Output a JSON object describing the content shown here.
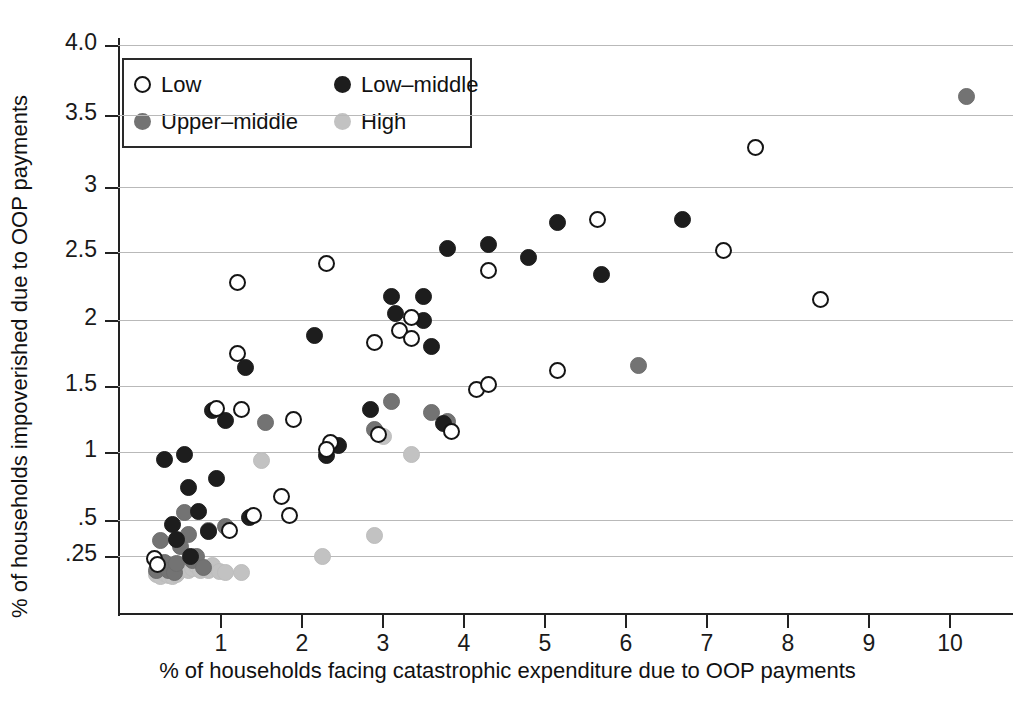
{
  "chart_data": {
    "type": "scatter",
    "title": "",
    "xlabel": "% of households facing catastrophic expenditure due to OOP payments",
    "ylabel": "% of households impoverished due to OOP payments",
    "xlim": [
      0.05,
      10.7
    ],
    "ylim": [
      0.1,
      4.15
    ],
    "x_ticks": [
      "1",
      "2",
      "3",
      "4",
      "5",
      "6",
      "7",
      "8",
      "9",
      "10"
    ],
    "x_tick_values": [
      1,
      2,
      3,
      4,
      5,
      6,
      7,
      8,
      9,
      10
    ],
    "y_ticks": [
      ".25",
      ".5",
      "1",
      "1.5",
      "2",
      "2.5",
      "3",
      "3.5",
      "4.0"
    ],
    "y_tick_values": [
      0.25,
      0.5,
      1,
      1.5,
      2,
      2.5,
      3,
      3.5,
      4.0
    ],
    "grid": "horizontal",
    "legend_position": "top-left",
    "legend": [
      {
        "key": "low",
        "label": "Low",
        "color": "#ffffff",
        "edge": "#141414"
      },
      {
        "key": "lowmid",
        "label": "Low–middle",
        "color": "#1d1d1d",
        "edge": "#1d1d1d"
      },
      {
        "key": "uppermid",
        "label": "Upper–middle",
        "color": "#737373",
        "edge": "#6e6e6e"
      },
      {
        "key": "high",
        "label": "High",
        "color": "#c2c2c2",
        "edge": "#bdbdbd"
      }
    ],
    "series": [
      {
        "name": "Low",
        "key": "low",
        "points": [
          [
            0.18,
            0.235
          ],
          [
            0.22,
            0.205
          ],
          [
            0.95,
            1.315
          ],
          [
            1.2,
            2.27
          ],
          [
            1.2,
            1.735
          ],
          [
            1.25,
            1.31
          ],
          [
            1.1,
            0.415
          ],
          [
            1.4,
            0.525
          ],
          [
            1.75,
            0.65
          ],
          [
            1.85,
            0.525
          ],
          [
            1.9,
            1.235
          ],
          [
            2.3,
            2.41
          ],
          [
            2.35,
            1.065
          ],
          [
            2.3,
            1.02
          ],
          [
            2.9,
            1.825
          ],
          [
            3.2,
            1.915
          ],
          [
            3.35,
            2.02
          ],
          [
            3.35,
            1.855
          ],
          [
            2.95,
            1.12
          ],
          [
            3.85,
            1.145
          ],
          [
            4.15,
            1.475
          ],
          [
            4.3,
            1.51
          ],
          [
            4.3,
            2.355
          ],
          [
            5.15,
            1.61
          ],
          [
            5.65,
            2.745
          ],
          [
            7.2,
            2.51
          ],
          [
            7.6,
            3.27
          ],
          [
            8.4,
            2.145
          ]
        ]
      },
      {
        "name": "Low–middle",
        "key": "lowmid",
        "points": [
          [
            0.3,
            0.94
          ],
          [
            0.4,
            0.465
          ],
          [
            0.45,
            0.355
          ],
          [
            0.55,
            0.975
          ],
          [
            0.6,
            0.72
          ],
          [
            0.62,
            0.25
          ],
          [
            0.72,
            0.555
          ],
          [
            0.85,
            0.41
          ],
          [
            0.95,
            0.785
          ],
          [
            0.9,
            1.305
          ],
          [
            1.05,
            1.225
          ],
          [
            1.3,
            1.63
          ],
          [
            1.35,
            0.515
          ],
          [
            2.15,
            1.88
          ],
          [
            2.3,
            0.97
          ],
          [
            2.45,
            1.045
          ],
          [
            2.85,
            1.31
          ],
          [
            3.1,
            2.17
          ],
          [
            3.15,
            2.045
          ],
          [
            3.5,
            2.165
          ],
          [
            3.5,
            2.0
          ],
          [
            3.6,
            1.79
          ],
          [
            3.75,
            1.2
          ],
          [
            3.8,
            2.525
          ],
          [
            4.3,
            2.555
          ],
          [
            4.8,
            2.455
          ],
          [
            5.15,
            2.725
          ],
          [
            5.7,
            2.325
          ],
          [
            6.7,
            2.745
          ]
        ]
      },
      {
        "name": "Upper–middle",
        "key": "uppermid",
        "points": [
          [
            0.2,
            0.175
          ],
          [
            0.25,
            0.35
          ],
          [
            0.3,
            0.215
          ],
          [
            0.35,
            0.175
          ],
          [
            0.42,
            0.165
          ],
          [
            0.45,
            0.21
          ],
          [
            0.5,
            0.31
          ],
          [
            0.55,
            0.545
          ],
          [
            0.6,
            0.39
          ],
          [
            0.65,
            0.225
          ],
          [
            0.7,
            0.245
          ],
          [
            0.78,
            0.19
          ],
          [
            0.85,
            0.415
          ],
          [
            1.05,
            0.445
          ],
          [
            1.55,
            1.21
          ],
          [
            2.9,
            1.16
          ],
          [
            3.1,
            1.375
          ],
          [
            3.6,
            1.285
          ],
          [
            3.8,
            1.22
          ],
          [
            6.15,
            1.645
          ],
          [
            10.2,
            3.63
          ]
        ]
      },
      {
        "name": "High",
        "key": "high",
        "points": [
          [
            0.2,
            0.155
          ],
          [
            0.25,
            0.145
          ],
          [
            0.3,
            0.16
          ],
          [
            0.35,
            0.15
          ],
          [
            0.4,
            0.145
          ],
          [
            0.45,
            0.155
          ],
          [
            0.5,
            0.175
          ],
          [
            0.55,
            0.19
          ],
          [
            0.6,
            0.175
          ],
          [
            0.65,
            0.185
          ],
          [
            0.7,
            0.2
          ],
          [
            0.75,
            0.175
          ],
          [
            0.8,
            0.19
          ],
          [
            0.85,
            0.175
          ],
          [
            0.9,
            0.2
          ],
          [
            0.98,
            0.17
          ],
          [
            1.05,
            0.165
          ],
          [
            1.25,
            0.165
          ],
          [
            1.5,
            0.93
          ],
          [
            2.25,
            0.245
          ],
          [
            2.9,
            0.38
          ],
          [
            3.0,
            1.105
          ],
          [
            3.35,
            0.975
          ]
        ]
      }
    ]
  }
}
